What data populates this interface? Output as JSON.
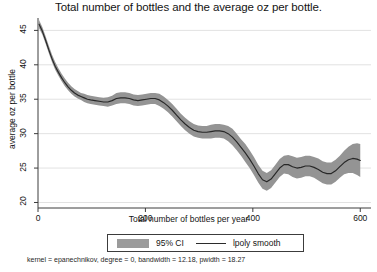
{
  "chart_data": {
    "type": "line",
    "title": "Total number of bottles and the average oz per bottle.",
    "xlabel": "Total number of bottles per year",
    "ylabel": "average oz per bottle",
    "xlim": [
      0,
      620
    ],
    "ylim": [
      19.2,
      46.8
    ],
    "xticks": [
      0,
      200,
      400,
      600
    ],
    "yticks": [
      20,
      25,
      30,
      35,
      40,
      45
    ],
    "grid": "horizontal",
    "legend_position": "bottom",
    "legend": [
      {
        "label": "95% CI",
        "type": "band",
        "color": "#9b9b9b"
      },
      {
        "label": "lpoly smooth",
        "type": "line",
        "color": "#2b2b2b"
      }
    ],
    "note": "kernel = epanechnikov, degree = 0, bandwidth = 12.18, pwidth = 18.27",
    "series": [
      {
        "name": "lpoly smooth",
        "x": [
          2,
          8,
          14,
          20,
          26,
          32,
          38,
          44,
          50,
          56,
          62,
          68,
          74,
          80,
          86,
          92,
          98,
          106,
          114,
          122,
          130,
          138,
          146,
          154,
          162,
          170,
          178,
          186,
          194,
          202,
          210,
          218,
          226,
          234,
          242,
          250,
          258,
          266,
          274,
          282,
          290,
          298,
          306,
          314,
          322,
          330,
          338,
          346,
          354,
          362,
          370,
          378,
          386,
          394,
          402,
          410,
          418,
          426,
          434,
          442,
          450,
          458,
          466,
          474,
          482,
          490,
          498,
          506,
          514,
          522,
          530,
          538,
          546,
          554,
          562,
          570,
          578,
          586,
          594,
          600
        ],
        "y": [
          45.9,
          44.9,
          43.6,
          42.2,
          40.9,
          39.8,
          38.9,
          38.1,
          37.4,
          36.8,
          36.3,
          35.9,
          35.6,
          35.4,
          35.2,
          35.0,
          34.9,
          34.8,
          34.7,
          34.6,
          34.6,
          34.8,
          35.1,
          35.2,
          35.2,
          35.1,
          34.9,
          34.8,
          34.9,
          35.0,
          35.1,
          35.1,
          34.9,
          34.5,
          34.0,
          33.4,
          32.7,
          32.0,
          31.4,
          30.9,
          30.5,
          30.3,
          30.2,
          30.2,
          30.3,
          30.4,
          30.4,
          30.3,
          30.0,
          29.5,
          28.8,
          28.0,
          27.2,
          26.3,
          25.3,
          24.2,
          23.3,
          23.0,
          23.4,
          24.2,
          25.0,
          25.5,
          25.5,
          25.2,
          25.0,
          25.1,
          25.3,
          25.3,
          25.1,
          24.8,
          24.4,
          24.2,
          24.2,
          24.6,
          25.2,
          25.8,
          26.2,
          26.4,
          26.3,
          26.1
        ],
        "ci_lower": [
          45.3,
          44.4,
          43.1,
          41.7,
          40.4,
          39.3,
          38.4,
          37.6,
          36.9,
          36.3,
          35.8,
          35.4,
          35.1,
          34.9,
          34.6,
          34.4,
          34.3,
          34.2,
          34.1,
          34.0,
          33.9,
          34.1,
          34.3,
          34.4,
          34.4,
          34.3,
          34.1,
          34.0,
          34.1,
          34.2,
          34.3,
          34.3,
          34.0,
          33.6,
          33.1,
          32.5,
          31.8,
          31.1,
          30.5,
          30.0,
          29.6,
          29.4,
          29.3,
          29.3,
          29.3,
          29.4,
          29.4,
          29.3,
          28.9,
          28.3,
          27.6,
          26.8,
          25.9,
          25.0,
          24.0,
          22.9,
          22.0,
          21.7,
          22.1,
          22.9,
          23.7,
          24.2,
          24.1,
          23.7,
          23.5,
          23.6,
          23.8,
          23.8,
          23.6,
          23.2,
          22.8,
          22.6,
          22.6,
          23.0,
          23.6,
          24.1,
          24.3,
          24.3,
          24.0,
          23.7
        ],
        "ci_upper": [
          46.5,
          45.5,
          44.2,
          42.8,
          41.5,
          40.4,
          39.5,
          38.7,
          38.0,
          37.4,
          36.9,
          36.5,
          36.2,
          35.9,
          35.8,
          35.6,
          35.5,
          35.4,
          35.3,
          35.2,
          35.3,
          35.5,
          35.9,
          36.0,
          36.0,
          35.9,
          35.7,
          35.6,
          35.7,
          35.8,
          35.9,
          35.9,
          35.8,
          35.4,
          34.9,
          34.3,
          33.6,
          32.9,
          32.3,
          31.8,
          31.4,
          31.2,
          31.1,
          31.1,
          31.3,
          31.4,
          31.4,
          31.3,
          31.1,
          30.7,
          30.0,
          29.2,
          28.5,
          27.6,
          26.6,
          25.5,
          24.6,
          24.3,
          24.7,
          25.5,
          26.3,
          26.8,
          26.9,
          26.7,
          26.5,
          26.6,
          26.8,
          26.8,
          26.6,
          26.4,
          26.0,
          25.8,
          25.8,
          26.2,
          26.8,
          27.5,
          28.1,
          28.5,
          28.6,
          28.5
        ]
      }
    ]
  }
}
